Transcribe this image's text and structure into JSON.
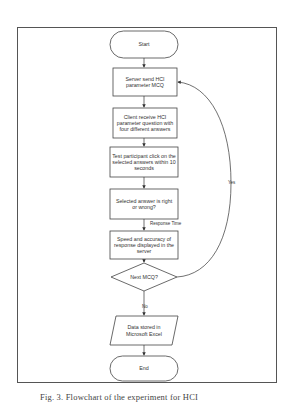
{
  "diagram": {
    "type": "flowchart",
    "nodes": {
      "start": {
        "shape": "terminal",
        "label": "Start"
      },
      "step1": {
        "shape": "process",
        "label": "Server send HCI parameter MCQ"
      },
      "step2": {
        "shape": "process",
        "label": "Client receive HCI parameter question with four different answers"
      },
      "step3": {
        "shape": "process",
        "label": "Test participant click on the selected answers within 10 seconds"
      },
      "step4": {
        "shape": "process",
        "label": "Selected answer is right or wrong?"
      },
      "step5": {
        "shape": "process",
        "label": "Speed and accuracy of response displayed in the server"
      },
      "decision": {
        "shape": "decision",
        "label": "Next MCQ?"
      },
      "output": {
        "shape": "data",
        "label": "Data stored in Microsoft Excel"
      },
      "end": {
        "shape": "terminal",
        "label": "End"
      }
    },
    "edges": {
      "response_time": "Response Time",
      "yes": "Yes",
      "no": "No"
    },
    "caption": "Fig. 3. Flowchart of the experiment for HCI"
  }
}
